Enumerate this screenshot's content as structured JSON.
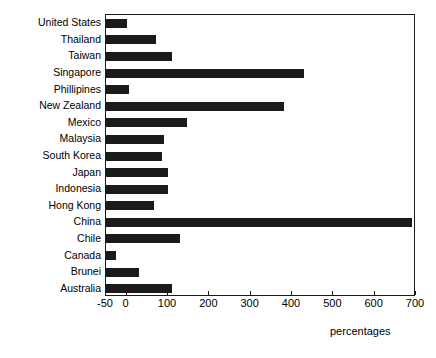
{
  "chart_data": {
    "type": "bar",
    "orientation": "horizontal",
    "title": "",
    "xlabel": "percentages",
    "ylabel": "",
    "xlim": [
      -50,
      700
    ],
    "xticks": [
      -50,
      0,
      100,
      200,
      300,
      400,
      500,
      600,
      700
    ],
    "xtick_labels": [
      "-50",
      "0",
      "100",
      "200",
      "300",
      "400",
      "500",
      "600",
      "700"
    ],
    "grid": false,
    "legend": false,
    "bar_color": "#1b1b1b",
    "frame_color": "#1a1a1a",
    "categories": [
      "United States",
      "Thailand",
      "Taiwan",
      "Singapore",
      "Phillipines",
      "New Zealand",
      "Mexico",
      "Malaysia",
      "South Korea",
      "Japan",
      "Indonesia",
      "Hong Kong",
      "China",
      "Chile",
      "Canada",
      "Brunei",
      "Australia"
    ],
    "values": [
      0,
      70,
      110,
      430,
      5,
      380,
      145,
      90,
      85,
      100,
      100,
      65,
      690,
      130,
      -25,
      30,
      110
    ]
  },
  "axis": {
    "x_title": "percentages"
  }
}
